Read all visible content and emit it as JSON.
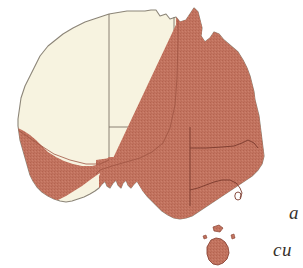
{
  "figure": {
    "type": "distribution-map",
    "region": "Australia",
    "background_color": "#ffffff",
    "land_unshaded_color": "#f7f3e0",
    "land_shaded_color": "#c2735f",
    "coastline_color": "#8c8578",
    "state_border_color": "#7d7468",
    "shaded_border_color": "#8a4334",
    "texture": "stipple"
  },
  "caption": {
    "line_1": "a",
    "line_2": "cu"
  },
  "legend": {
    "shaded_meaning": "distribution range",
    "unshaded_meaning": "outside range"
  },
  "states": [
    {
      "name": "Western Australia",
      "abbr": "WA",
      "shaded": "partial-southwest"
    },
    {
      "name": "Northern Territory",
      "abbr": "NT",
      "shaded": "none"
    },
    {
      "name": "South Australia",
      "abbr": "SA",
      "shaded": "partial-southeast"
    },
    {
      "name": "Queensland",
      "abbr": "QLD",
      "shaded": "full"
    },
    {
      "name": "New South Wales",
      "abbr": "NSW",
      "shaded": "full"
    },
    {
      "name": "Victoria",
      "abbr": "VIC",
      "shaded": "full"
    },
    {
      "name": "Tasmania",
      "abbr": "TAS",
      "shaded": "full"
    },
    {
      "name": "Australian Capital Territory",
      "abbr": "ACT",
      "shaded": "full"
    }
  ],
  "islands": [
    {
      "name": "Tasmania",
      "shaded": true
    },
    {
      "name": "King Island",
      "shaded": true
    },
    {
      "name": "Flinders Island",
      "shaded": true
    }
  ]
}
